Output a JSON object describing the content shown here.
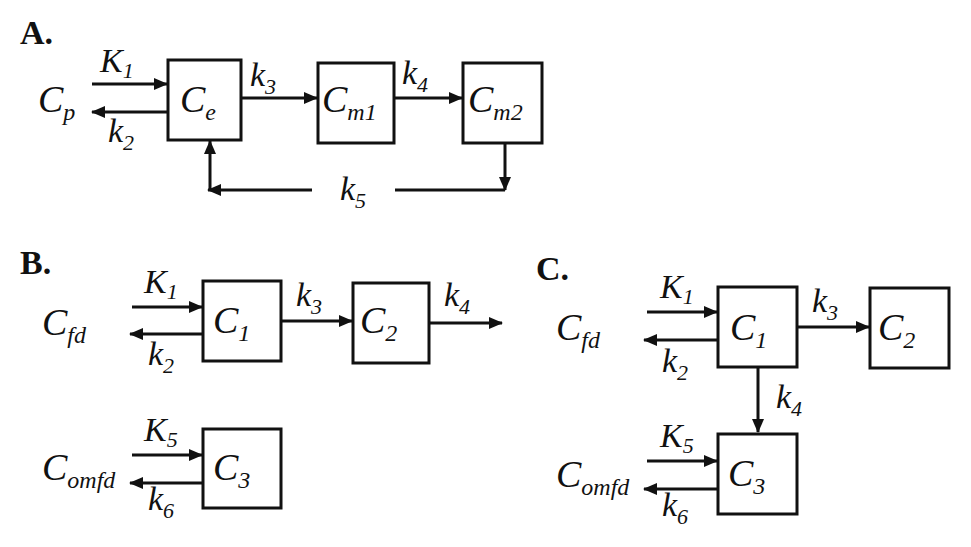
{
  "panels": {
    "A": {
      "label": "A.",
      "input": {
        "main": "C",
        "sub": "p"
      },
      "compartments": [
        {
          "main": "C",
          "sub": "e"
        },
        {
          "main": "C",
          "sub": "m1"
        },
        {
          "main": "C",
          "sub": "m2"
        }
      ],
      "rates": {
        "in": {
          "main": "K",
          "sub": "1"
        },
        "out": {
          "main": "k",
          "sub": "2"
        },
        "r3": {
          "main": "k",
          "sub": "3"
        },
        "r4": {
          "main": "k",
          "sub": "4"
        },
        "r5": {
          "main": "k",
          "sub": "5"
        }
      }
    },
    "B": {
      "label": "B.",
      "input1": {
        "main": "C",
        "sub": "fd"
      },
      "input2": {
        "main": "C",
        "sub": "omfd"
      },
      "compartments": [
        {
          "main": "C",
          "sub": "1"
        },
        {
          "main": "C",
          "sub": "2"
        },
        {
          "main": "C",
          "sub": "3"
        }
      ],
      "rates": {
        "K1": {
          "main": "K",
          "sub": "1"
        },
        "k2": {
          "main": "k",
          "sub": "2"
        },
        "k3": {
          "main": "k",
          "sub": "3"
        },
        "k4": {
          "main": "k",
          "sub": "4"
        },
        "K5": {
          "main": "K",
          "sub": "5"
        },
        "k6": {
          "main": "k",
          "sub": "6"
        }
      }
    },
    "C": {
      "label": "C.",
      "input1": {
        "main": "C",
        "sub": "fd"
      },
      "input2": {
        "main": "C",
        "sub": "omfd"
      },
      "compartments": [
        {
          "main": "C",
          "sub": "1"
        },
        {
          "main": "C",
          "sub": "2"
        },
        {
          "main": "C",
          "sub": "3"
        }
      ],
      "rates": {
        "K1": {
          "main": "K",
          "sub": "1"
        },
        "k2": {
          "main": "k",
          "sub": "2"
        },
        "k3": {
          "main": "k",
          "sub": "3"
        },
        "k4": {
          "main": "k",
          "sub": "4"
        },
        "K5": {
          "main": "K",
          "sub": "5"
        },
        "k6": {
          "main": "k",
          "sub": "6"
        }
      }
    }
  }
}
